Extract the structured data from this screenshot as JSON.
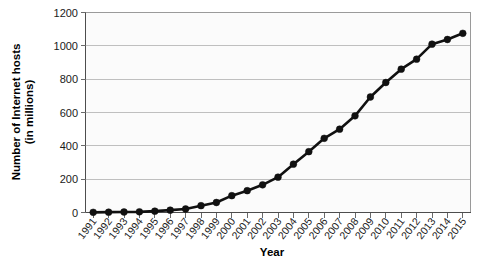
{
  "chart_data": {
    "type": "line",
    "title": "",
    "xlabel": "Year",
    "ylabel": "Number of Internet hosts (in millions)",
    "ylabel_line1": "Number of Internet hosts",
    "ylabel_line2": "(in millions)",
    "ylim": [
      0,
      1200
    ],
    "yticks": [
      0,
      200,
      400,
      600,
      800,
      1000,
      1200
    ],
    "ytick_labels": [
      "0",
      "200",
      "400",
      "600",
      "800",
      "1000",
      "1200"
    ],
    "grid": true,
    "grid_axis": "y",
    "legend": false,
    "legend_position": "none",
    "marker": "circle",
    "line_color": "#111111",
    "marker_color": "#111111",
    "plot_background": "#fbfbfb",
    "gridline_color": "#bfbfbf",
    "categories": [
      "1991",
      "1992",
      "1993",
      "1994",
      "1995",
      "1996",
      "1997",
      "1998",
      "1999",
      "2000",
      "2001",
      "2002",
      "2003",
      "2004",
      "2005",
      "2006",
      "2007",
      "2008",
      "2009",
      "2010",
      "2011",
      "2012",
      "2013",
      "2014",
      "2015"
    ],
    "x": [
      1991,
      1992,
      1993,
      1994,
      1995,
      1996,
      1997,
      1998,
      1999,
      2000,
      2001,
      2002,
      2003,
      2004,
      2005,
      2006,
      2007,
      2008,
      2009,
      2010,
      2011,
      2012,
      2013,
      2014,
      2015
    ],
    "values": [
      1,
      2,
      3,
      4,
      8,
      14,
      21,
      41,
      60,
      101,
      131,
      166,
      212,
      290,
      365,
      445,
      500,
      580,
      693,
      780,
      860,
      920,
      1010,
      1038,
      1075
    ],
    "series": [
      {
        "name": "Internet hosts",
        "values": [
          1,
          2,
          3,
          4,
          8,
          14,
          21,
          41,
          60,
          101,
          131,
          166,
          212,
          290,
          365,
          445,
          500,
          580,
          693,
          780,
          860,
          920,
          1010,
          1038,
          1075
        ]
      }
    ]
  }
}
